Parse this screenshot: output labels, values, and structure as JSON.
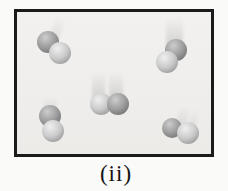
{
  "figure": {
    "caption": "(ii)",
    "molecule_count": 5,
    "colors": {
      "page_bg": "#fafaf9",
      "panel_bg": "#f0efec",
      "panel_border": "#1b1b1b",
      "caption_text": "#141414",
      "trail": "#b5b5b5",
      "sphere": {
        "dark": {
          "hi": "#cdcdcd",
          "mid": "#9d9d9d",
          "lo": "#6d6d6d"
        },
        "light": {
          "hi": "#efefef",
          "mid": "#cbcbcb",
          "lo": "#929292"
        }
      }
    },
    "molecules": [
      {
        "id": "top-left",
        "trails": [
          {
            "x": 52,
            "y": 16,
            "w": 10,
            "h": 27,
            "rot": 20,
            "opacity": 0.3
          }
        ],
        "atoms": [
          {
            "x": 48,
            "y": 42,
            "r": 11,
            "shade": "dark"
          },
          {
            "x": 60,
            "y": 53,
            "r": 11,
            "shade": "light"
          }
        ]
      },
      {
        "id": "top-right",
        "trails": [
          {
            "x": 166,
            "y": 17,
            "w": 17,
            "h": 34,
            "rot": 0,
            "opacity": 0.5
          }
        ],
        "atoms": [
          {
            "x": 176,
            "y": 50,
            "r": 11,
            "shade": "dark"
          },
          {
            "x": 167,
            "y": 62,
            "r": 11,
            "shade": "light"
          }
        ]
      },
      {
        "id": "center",
        "trails": [
          {
            "x": 92,
            "y": 72,
            "w": 13,
            "h": 31,
            "rot": 0,
            "opacity": 0.5
          },
          {
            "x": 109,
            "y": 72,
            "w": 14,
            "h": 31,
            "rot": 0,
            "opacity": 0.5
          }
        ],
        "atoms": [
          {
            "x": 101,
            "y": 104,
            "r": 11,
            "shade": "light"
          },
          {
            "x": 118,
            "y": 104,
            "r": 11,
            "shade": "dark"
          }
        ]
      },
      {
        "id": "bottom-left",
        "trails": [
          {
            "x": 44,
            "y": 96,
            "w": 13,
            "h": 18,
            "rot": 0,
            "opacity": 0.3
          }
        ],
        "atoms": [
          {
            "x": 50,
            "y": 116,
            "r": 11,
            "shade": "dark"
          },
          {
            "x": 53,
            "y": 131,
            "r": 11,
            "shade": "light"
          }
        ]
      },
      {
        "id": "bottom-right",
        "trails": [
          {
            "x": 178,
            "y": 106,
            "w": 10,
            "h": 21,
            "rot": 15,
            "opacity": 0.3
          },
          {
            "x": 190,
            "y": 110,
            "w": 8,
            "h": 18,
            "rot": 15,
            "opacity": 0.22
          }
        ],
        "atoms": [
          {
            "x": 172,
            "y": 128,
            "r": 10,
            "shade": "dark"
          },
          {
            "x": 188,
            "y": 133,
            "r": 11,
            "shade": "light"
          }
        ]
      }
    ]
  }
}
